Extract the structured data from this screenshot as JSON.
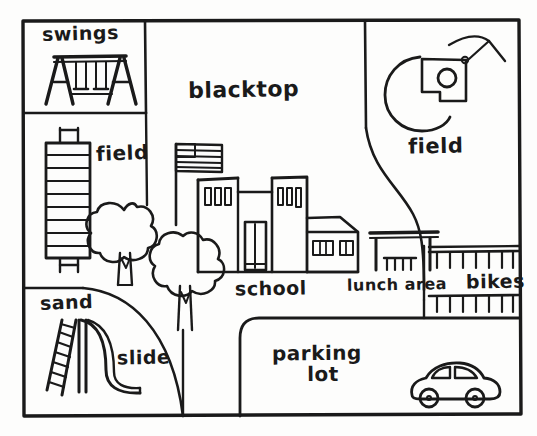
{
  "document": {
    "kind": "hand-drawn-map",
    "subject": "school campus map",
    "background_color": "#fdfdfc",
    "ink_color": "#1a1a1a",
    "width": 537,
    "height": 436
  },
  "labels": {
    "swings": "swings",
    "blacktop": "blacktop",
    "field_left": "field",
    "field_right": "field",
    "school": "school",
    "lunch_area": "lunch area",
    "bikes": "bikes",
    "sand": "sand",
    "slide": "slide",
    "parking_line1": "parking",
    "parking_line2": "lot"
  },
  "zones": [
    {
      "id": "swings",
      "label": "swings",
      "position": "top-left"
    },
    {
      "id": "field-left",
      "label": "field",
      "position": "mid-left"
    },
    {
      "id": "blacktop",
      "label": "blacktop",
      "position": "top-center"
    },
    {
      "id": "field-right",
      "label": "field",
      "position": "top-right"
    },
    {
      "id": "school",
      "label": "school",
      "position": "center"
    },
    {
      "id": "lunch-area",
      "label": "lunch area",
      "position": "center-right"
    },
    {
      "id": "bikes",
      "label": "bikes",
      "position": "right"
    },
    {
      "id": "sand",
      "label": "sand",
      "position": "bottom-left"
    },
    {
      "id": "slide",
      "label": "slide",
      "position": "bottom-left"
    },
    {
      "id": "parking-lot",
      "label": "parking lot",
      "position": "bottom-right"
    }
  ],
  "drawings": [
    {
      "id": "swing-set",
      "description": "A-frame swing set with three swings"
    },
    {
      "id": "monkey-bars",
      "description": "ladder of horizontal bars with goal posts"
    },
    {
      "id": "baseball-diamond",
      "description": "infield arc with pitcher mound and home plate"
    },
    {
      "id": "school-building",
      "description": "multi-section building with windows, doors and side wing"
    },
    {
      "id": "flag",
      "description": "flag on pole beside the school"
    },
    {
      "id": "tree-upper",
      "description": "cloud-shaped tree with trunk"
    },
    {
      "id": "tree-lower",
      "description": "cloud-shaped tree with trunk"
    },
    {
      "id": "picnic-table",
      "description": "long picnic table with legs and benches"
    },
    {
      "id": "bike-rack-top",
      "description": "comb-shaped bike rack"
    },
    {
      "id": "bike-rack-bottom",
      "description": "comb-shaped bike rack"
    },
    {
      "id": "slide-structure",
      "description": "ladder with curving slide chute"
    },
    {
      "id": "car",
      "description": "car with two wheels and windows"
    }
  ]
}
